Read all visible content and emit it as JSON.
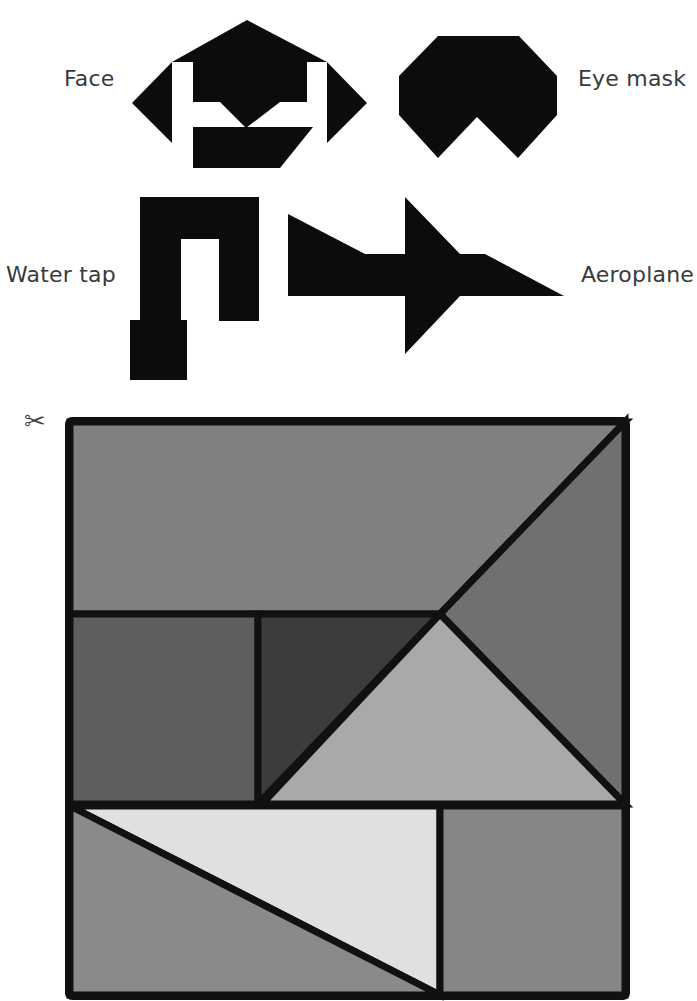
{
  "figures": [
    {
      "id": "face",
      "label": "Face"
    },
    {
      "id": "eye-mask",
      "label": "Eye mask"
    },
    {
      "id": "water-tap",
      "label": "Water tap"
    },
    {
      "id": "aeroplane",
      "label": "Aeroplane"
    }
  ],
  "cutout": {
    "icon": "scissors-icon",
    "glyph": "✂",
    "description": "Tangram square with seven pieces to cut out",
    "colors": {
      "outline": "#111111",
      "top_parallelogram": "#808080",
      "right_large_triangle": "#707070",
      "left_square": "#5e5e5e",
      "dark_small_triangle": "#3c3c3c",
      "middle_triangle": "#a9a9a9",
      "bottom_light_triangle": "#e0e0e0",
      "bottom_left_triangle": "#8a8a8a",
      "bottom_right_square": "#868686"
    }
  },
  "silhouette_color": "#0c0c0c"
}
